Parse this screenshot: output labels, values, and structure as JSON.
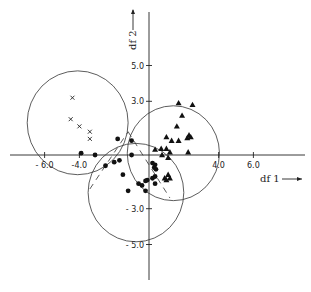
{
  "chart_data": {
    "type": "scatter",
    "title": "",
    "xlabel": "df 1",
    "ylabel": "df 2",
    "xlim": [
      -8.5,
      8.5
    ],
    "ylim": [
      -7.5,
      8.5
    ],
    "grid": false,
    "legend": null,
    "x_ticks": [
      {
        "value": -6.0,
        "label": "- 6.0"
      },
      {
        "value": -4.0,
        "label": "-4.0"
      },
      {
        "value": 4.0,
        "label": "4.0"
      },
      {
        "value": 6.0,
        "label": "6.0"
      }
    ],
    "y_ticks": [
      {
        "value": 5.0,
        "label": "5.0"
      },
      {
        "value": 3.0,
        "label": "3.0"
      },
      {
        "value": -3.0,
        "label": "- 3.0"
      },
      {
        "value": -5.0,
        "label": "- 5.0"
      }
    ],
    "series": [
      {
        "name": "group-cross",
        "marker": "x",
        "points": [
          [
            -4.4,
            3.2
          ],
          [
            -4.5,
            2.0
          ],
          [
            -4.0,
            1.6
          ],
          [
            -3.4,
            1.3
          ],
          [
            -3.4,
            0.9
          ]
        ]
      },
      {
        "name": "group-dot",
        "marker": "circle-filled",
        "points": [
          [
            -3.9,
            0.1
          ],
          [
            -3.1,
            0.0
          ],
          [
            -2.5,
            -0.6
          ],
          [
            -2.0,
            -0.4
          ],
          [
            -1.7,
            -0.3
          ],
          [
            -1.8,
            0.9
          ],
          [
            -1.0,
            0.8
          ],
          [
            -1.0,
            0.0
          ],
          [
            -1.5,
            -1.1
          ],
          [
            -1.2,
            -2.0
          ],
          [
            -0.6,
            -1.6
          ],
          [
            -0.4,
            -1.7
          ],
          [
            -0.2,
            -2.0
          ],
          [
            -0.1,
            -1.4
          ],
          [
            0.2,
            -1.3
          ],
          [
            0.3,
            -0.7
          ],
          [
            0.35,
            -0.55
          ],
          [
            0.2,
            -0.45
          ],
          [
            0.4,
            -0.8
          ],
          [
            0.35,
            -1.2
          ],
          [
            0.35,
            -1.6
          ],
          [
            -0.2,
            -1.45
          ]
        ]
      },
      {
        "name": "group-triangle",
        "marker": "triangle-filled",
        "points": [
          [
            1.7,
            2.9
          ],
          [
            2.5,
            2.8
          ],
          [
            1.9,
            2.2
          ],
          [
            1.6,
            1.6
          ],
          [
            1.0,
            1.0
          ],
          [
            1.3,
            0.8
          ],
          [
            1.7,
            0.8
          ],
          [
            2.2,
            0.95
          ],
          [
            2.3,
            1.1
          ],
          [
            2.4,
            1.0
          ],
          [
            0.35,
            0.3
          ],
          [
            0.7,
            0.35
          ],
          [
            1.0,
            0.35
          ],
          [
            0.75,
            0.0
          ],
          [
            1.2,
            0.15
          ],
          [
            1.1,
            -0.15
          ],
          [
            2.25,
            0.15
          ],
          [
            1.1,
            -1.1
          ],
          [
            0.9,
            -1.3
          ],
          [
            1.0,
            -1.4
          ],
          [
            1.2,
            -1.3
          ]
        ]
      }
    ],
    "circles": [
      {
        "name": "circle-cross-group",
        "center": [
          -4.1,
          1.8
        ],
        "radius": 2.9
      },
      {
        "name": "circle-dot-group",
        "center": [
          -0.75,
          -2.1
        ],
        "radius": 2.75
      },
      {
        "name": "circle-triangle-group",
        "center": [
          1.4,
          0.1
        ],
        "radius": 2.65
      }
    ],
    "dashed_lines": [
      {
        "from": [
          -3.4,
          -1.9
        ],
        "to": [
          -1.2,
          1.3
        ]
      },
      {
        "from": [
          -1.2,
          1.3
        ],
        "to": [
          1.2,
          -2.4
        ]
      }
    ]
  },
  "axes": {
    "x_label": "df 1",
    "y_label": "df 2",
    "x_arrow": "→",
    "y_arrow": "→"
  }
}
